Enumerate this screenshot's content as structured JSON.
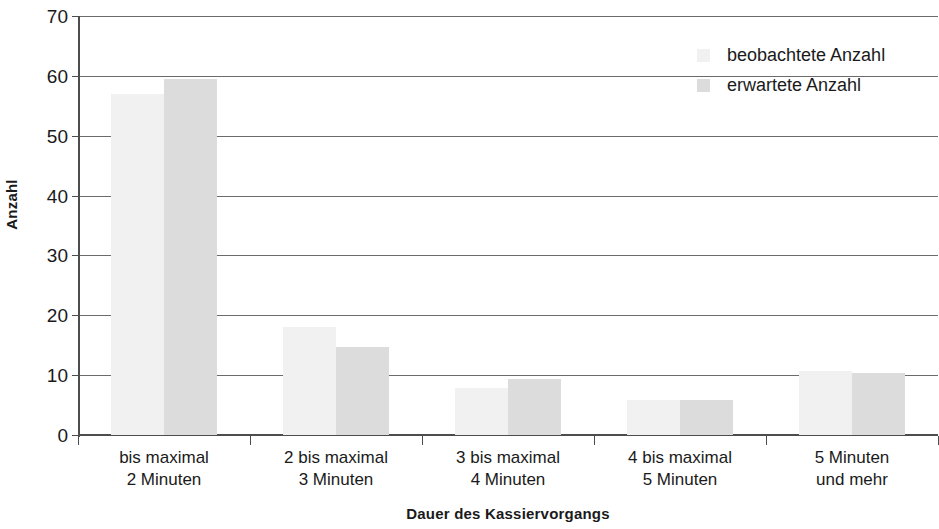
{
  "chart_data": {
    "type": "bar",
    "title": "",
    "subtitle": "",
    "xlabel": "Dauer des Kassiervorgangs",
    "ylabel": "Anzahl",
    "categories": [
      "bis maximal\n2 Minuten",
      "2 bis maximal\n3 Minuten",
      "3 bis maximal\n4 Minuten",
      "4 bis maximal\n5 Minuten",
      "5 Minuten\nund mehr"
    ],
    "category_lines": [
      [
        "bis maximal",
        "2 Minuten"
      ],
      [
        "2 bis maximal",
        "3 Minuten"
      ],
      [
        "3 bis maximal",
        "4 Minuten"
      ],
      [
        "4 bis maximal",
        "5 Minuten"
      ],
      [
        "5 Minuten",
        "und mehr"
      ]
    ],
    "series": [
      {
        "name": "beobachtete Anzahl",
        "color": "#f1f1f1",
        "values": [
          57,
          18,
          7.8,
          5.9,
          10.7
        ]
      },
      {
        "name": "erwartete Anzahl",
        "color": "#dcdcdc",
        "values": [
          59.4,
          14.7,
          9.3,
          5.9,
          10.4
        ]
      }
    ],
    "ylim": [
      0,
      70
    ],
    "yticks": [
      0,
      10,
      20,
      30,
      40,
      50,
      60,
      70
    ],
    "ytick_labels": [
      "0",
      "10",
      "20",
      "30",
      "40",
      "50",
      "60",
      "70"
    ],
    "grid": "horizontal",
    "legend_position": "top-right",
    "legend_entries": [
      "beobachtete Anzahl",
      "erwartete Anzahl"
    ]
  }
}
